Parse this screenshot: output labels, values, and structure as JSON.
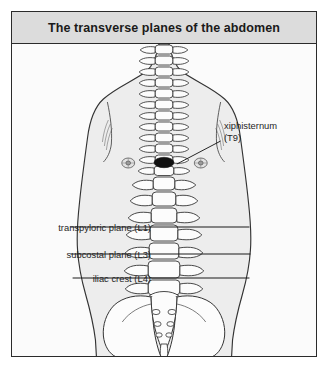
{
  "figure": {
    "title": "The transverse planes of the abdomen",
    "background_color": "#fbfbfb",
    "banner_color": "#dcdcdc",
    "border_color": "#2b2b2b"
  },
  "labels": {
    "transpyloric": "transpyloric plane (L1)",
    "subcostal": "subcostal plane (L3)",
    "iliac_crest": "iliac crest (L4)",
    "xiphisternum_name": "xiphisternum",
    "xiphisternum_level": "(T9)"
  },
  "markers": {
    "xiphisternum_marker": "black-oval-marker",
    "left_nipple_marker": "nipple-marker",
    "right_nipple_marker": "nipple-marker"
  },
  "anatomy": {
    "body_fill": "#ededed",
    "bone_fill": "#fcfcfc",
    "outline_color": "#333333",
    "plane_line_color": "#1a1a1a"
  }
}
